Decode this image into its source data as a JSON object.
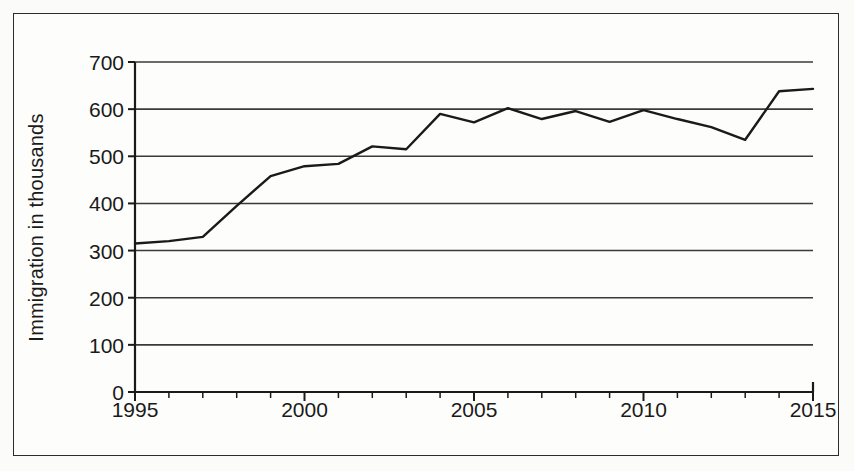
{
  "chart_data": {
    "type": "line",
    "title": "",
    "subtitle": "",
    "xlabel": "",
    "ylabel": "Immigration in thousands",
    "xlim": [
      1995,
      2015
    ],
    "ylim": [
      0,
      700
    ],
    "y_ticks": [
      0,
      100,
      200,
      300,
      400,
      500,
      600,
      700
    ],
    "y_tick_labels": [
      "0",
      "100",
      "200",
      "300",
      "400",
      "500",
      "600",
      "700"
    ],
    "x_ticks": [
      1995,
      1996,
      1997,
      1998,
      1999,
      2000,
      2001,
      2002,
      2003,
      2004,
      2005,
      2006,
      2007,
      2008,
      2009,
      2010,
      2011,
      2012,
      2013,
      2014,
      2015
    ],
    "x_tick_labels_shown": [
      "1995",
      "2000",
      "2005",
      "2010",
      "2015"
    ],
    "x_labeled_ticks": [
      1995,
      2000,
      2005,
      2010,
      2015
    ],
    "grid": "horizontal",
    "legend": "none",
    "line_color": "#1a1a1a",
    "line_width": 2.4,
    "markers": "none",
    "x": [
      1995,
      1996,
      1997,
      1998,
      1999,
      2000,
      2001,
      2002,
      2003,
      2004,
      2005,
      2006,
      2007,
      2008,
      2009,
      2010,
      2011,
      2012,
      2013,
      2014,
      2015
    ],
    "values": [
      315,
      320,
      329,
      395,
      458,
      479,
      484,
      521,
      515,
      590,
      572,
      602,
      579,
      596,
      573,
      598,
      579,
      562,
      535,
      638,
      643
    ],
    "series": [
      {
        "name": "Immigration",
        "values": [
          315,
          320,
          329,
          395,
          458,
          479,
          484,
          521,
          515,
          590,
          572,
          602,
          579,
          596,
          573,
          598,
          579,
          562,
          535,
          638,
          643
        ]
      }
    ]
  },
  "figure": {
    "background_color": "#fbfbf9",
    "frame_color": "#2c2c2c",
    "axis_color": "#1a1a1a",
    "gridline_color": "#3a3a3a"
  }
}
